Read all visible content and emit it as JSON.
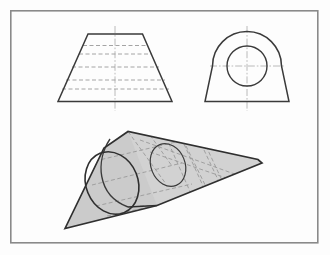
{
  "figure": {
    "page_background": "#fdfdfd",
    "frame": {
      "name": "drawing-border",
      "stroke": "#8a8a8a",
      "stroke_width": 1.6,
      "x": 10,
      "y": 10,
      "width": 308,
      "height": 233
    },
    "style": {
      "visible_line_color": "#3a3a3a",
      "visible_line_width": 1.4,
      "hidden_line_color": "#9a9a9a",
      "hidden_line_width": 0.9,
      "hidden_dash": "4,2.5",
      "center_line_color": "#a8a8a8",
      "center_line_width": 0.8,
      "center_dash": "7,2,1.6,2",
      "solid_fill": "#c9c9c9",
      "solid_fill_alt": "#d2d2d2"
    },
    "views": [
      {
        "id": "front-view",
        "label": "Front view",
        "type": "trapezoid-with-hidden-lines",
        "outline_points": "88,34 142,34 172,101 58,101",
        "center_line": {
          "x": 115,
          "y1": 26,
          "y2": 110
        },
        "hidden_lines": [
          {
            "y": 45,
            "x1": 83,
            "x2": 148
          },
          {
            "y": 53,
            "x1": 79,
            "x2": 152
          },
          {
            "y": 66,
            "x1": 73,
            "x2": 158
          },
          {
            "y": 80,
            "x1": 67,
            "x2": 164
          },
          {
            "y": 89,
            "x1": 63,
            "x2": 168
          }
        ]
      },
      {
        "id": "side-view",
        "label": "Side view",
        "type": "arched-block-with-circle",
        "outline_path": "M 205,101 L 213,66 A 34 34 0 0 1 281,66 L 289,101 Z",
        "arc_center": {
          "cx": 247,
          "cy": 66,
          "r": 34
        },
        "circle": {
          "cx": 247,
          "cy": 66,
          "r": 20
        },
        "center_line_vertical": {
          "x": 247,
          "y1": 26,
          "y2": 110
        },
        "center_line_horizontal": {
          "y": 66,
          "x1": 212,
          "x2": 283
        }
      },
      {
        "id": "isometric-view",
        "label": "Isometric pictorial view",
        "type": "wedge-with-through-hole",
        "front_face_path": "M 65,228 L 104,148 L 128,132 L 160,136 L 157,205 Z",
        "top_ridge": "128,132 258,160",
        "bottom_right_edge": "157,205 262,162",
        "base_edge": "65,228 157,205",
        "hole_front_ellipse": {
          "cx": 112,
          "cy": 183,
          "rx": 26,
          "ry": 32,
          "rotation": -22
        },
        "hole_mouth_arc": "M 107,140 A 30 36 -22 0 0 128,206",
        "hole_back_ellipse": {
          "cx": 168,
          "cy": 165,
          "rx": 17,
          "ry": 22,
          "rotation": -22
        },
        "hidden_lines": [
          "98,208 160,188",
          "96,160 150,146",
          "118,214 176,196",
          "128,132 164,178",
          "150,140 166,186",
          "190,148 214,200",
          "205,152 229,203",
          "140,204 225,201"
        ],
        "surface_lines": [
          "168,141 192,195",
          "208,151 232,202"
        ]
      }
    ]
  }
}
